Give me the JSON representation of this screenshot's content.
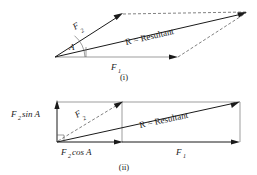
{
  "figure": {
    "background_color": "#ffffff",
    "line_color": "#1a1a1a",
    "thin_line_color": "#5a5a5a",
    "dash_line_color": "#4a4a4a"
  },
  "diagram_i": {
    "caption": "(i)",
    "labels": {
      "f1_base": "F",
      "f1_sub": "1",
      "f2_base": "F",
      "f2_sub": "2",
      "angle": "A",
      "resultant": "R = Resultant"
    }
  },
  "diagram_ii": {
    "caption": "(ii)",
    "labels": {
      "f1_base": "F",
      "f1_sub": "1",
      "f2_base": "F",
      "f2_sub": "2",
      "f2_sin_base": "F",
      "f2_sin_sub": "2",
      "f2_sin_rest": "sin A",
      "f2_cos_base": "F",
      "f2_cos_sub": "2",
      "f2_cos_rest": "cos A",
      "resultant": "R = Resultant"
    }
  }
}
